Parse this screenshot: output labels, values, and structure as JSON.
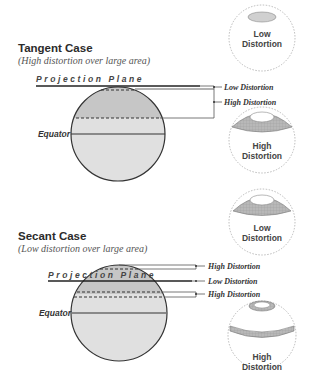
{
  "tangent": {
    "title": "Tangent Case",
    "subtitle": "(High distortion over large area)",
    "plane_label": "Projection Plane",
    "equator_label": "Equator",
    "callouts": [
      "Low Distortion",
      "High Distortion"
    ],
    "insets": [
      {
        "line1": "Low",
        "line2": "Distortion"
      },
      {
        "line1": "High",
        "line2": "Distortion"
      }
    ]
  },
  "secant": {
    "title": "Secant Case",
    "subtitle": "(Low distortion over large area)",
    "plane_label": "Projection Plane",
    "equator_label": "Equator",
    "callouts": [
      "High Distortion",
      "Low Distortion",
      "High Distortion"
    ],
    "insets": [
      {
        "line1": "Low",
        "line2": "Distortion"
      },
      {
        "line1": "High",
        "line2": "Distortion"
      }
    ]
  },
  "colors": {
    "globe_light": "#dedede",
    "globe_dark": "#c4c4c4",
    "stroke": "#333333",
    "dashed_circle": "#aaaaaa"
  }
}
